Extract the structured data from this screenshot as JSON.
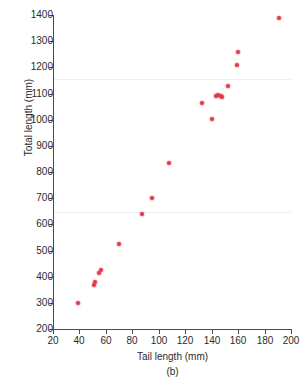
{
  "figure": {
    "panel_label": "(b)",
    "point_color": "#e03a4e",
    "axis_color": "#4a4a4a"
  },
  "chart_data": {
    "type": "scatter",
    "title": "",
    "xlabel": "Tail length (mm)",
    "ylabel": "Total length (mm)",
    "xlim": [
      20,
      200
    ],
    "ylim": [
      200,
      1400
    ],
    "xticks": [
      20,
      40,
      60,
      80,
      100,
      120,
      140,
      160,
      180,
      200
    ],
    "yticks": [
      200,
      300,
      400,
      500,
      600,
      700,
      800,
      900,
      1000,
      1100,
      1200,
      1300,
      1400
    ],
    "grid": false,
    "legend": null,
    "marker": "circle",
    "marker_color": "#e03a4e",
    "x": [
      39,
      51,
      52,
      55,
      56,
      70,
      87,
      95,
      108,
      133,
      140,
      143,
      145,
      147,
      148,
      152,
      159,
      160,
      191
    ],
    "y": [
      298,
      370,
      378,
      415,
      425,
      525,
      640,
      700,
      835,
      1062,
      1002,
      1090,
      1095,
      1090,
      1085,
      1128,
      1208,
      1258,
      1390
    ],
    "points": [
      {
        "x": 39,
        "y": 298
      },
      {
        "x": 51,
        "y": 370
      },
      {
        "x": 52,
        "y": 378
      },
      {
        "x": 55,
        "y": 415
      },
      {
        "x": 56,
        "y": 425
      },
      {
        "x": 70,
        "y": 525
      },
      {
        "x": 87,
        "y": 640
      },
      {
        "x": 95,
        "y": 700
      },
      {
        "x": 108,
        "y": 835
      },
      {
        "x": 133,
        "y": 1062
      },
      {
        "x": 140,
        "y": 1002
      },
      {
        "x": 143,
        "y": 1090
      },
      {
        "x": 145,
        "y": 1095
      },
      {
        "x": 147,
        "y": 1090
      },
      {
        "x": 148,
        "y": 1085
      },
      {
        "x": 152,
        "y": 1128
      },
      {
        "x": 159,
        "y": 1208
      },
      {
        "x": 160,
        "y": 1258
      },
      {
        "x": 191,
        "y": 1390
      }
    ]
  }
}
